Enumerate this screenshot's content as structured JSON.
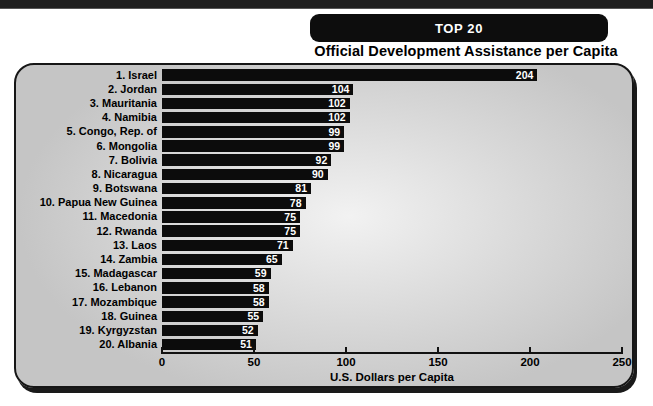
{
  "top_bar": {
    "present": true
  },
  "title": {
    "line1": "TOP 20",
    "line2": "Official Development Assistance per Capita"
  },
  "chart_data": {
    "type": "bar",
    "orientation": "horizontal",
    "title": "TOP 20",
    "subtitle": "Official Development Assistance per Capita",
    "categories": [
      "1. Israel",
      "2. Jordan",
      "3. Mauritania",
      "4. Namibia",
      "5. Congo, Rep. of",
      "6. Mongolia",
      "7. Bolivia",
      "8. Nicaragua",
      "9. Botswana",
      "10. Papua New Guinea",
      "11. Macedonia",
      "12. Rwanda",
      "13. Laos",
      "14. Zambia",
      "15. Madagascar",
      "16. Lebanon",
      "17. Mozambique",
      "18. Guinea",
      "19. Kyrgyzstan",
      "20. Albania"
    ],
    "values": [
      204,
      104,
      102,
      102,
      99,
      99,
      92,
      90,
      81,
      78,
      75,
      75,
      71,
      65,
      59,
      58,
      58,
      55,
      52,
      51
    ],
    "xlabel": "U.S. Dollars per Capita",
    "xticks": [
      0,
      50,
      100,
      150,
      200,
      250
    ],
    "xlim": [
      0,
      250
    ],
    "grid": false,
    "legend": false,
    "value_labels": "inside-bar-right",
    "colors": {
      "bar": "#0c0c0c",
      "value_label": "#ffffff",
      "panel_background": "#c5c5c5",
      "panel_glow": "#f2f2f2",
      "title_box_background": "#0d0d0d",
      "title_box_text": "#ffffff",
      "text": "#000000"
    }
  }
}
